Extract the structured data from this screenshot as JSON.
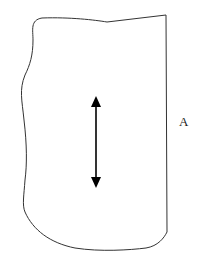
{
  "diagram": {
    "label": "A",
    "shape": "irregular outline with straight right edge",
    "arrow": "double-headed vertical arrow",
    "stroke_color": "#333333",
    "arrow_color": "#000000"
  }
}
